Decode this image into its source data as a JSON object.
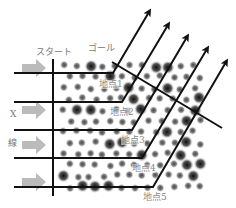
{
  "labels": {
    "start": "スタート",
    "goal": "ゴール",
    "axis_x": "X",
    "axis_line": "線"
  },
  "points": [
    {
      "label": "地点1",
      "turn": [
        113,
        73
      ],
      "tip": [
        149,
        12
      ],
      "lx": 99,
      "ly": 80
    },
    {
      "label": "地点2",
      "turn": [
        122,
        102
      ],
      "tip": [
        168,
        25
      ],
      "lx": 110,
      "ly": 108
    },
    {
      "label": "地点3",
      "turn": [
        132,
        130
      ],
      "tip": [
        187,
        37
      ],
      "lx": 121,
      "ly": 136
    },
    {
      "label": "地点4",
      "turn": [
        142,
        158
      ],
      "tip": [
        207,
        49
      ],
      "lx": 132,
      "ly": 164
    },
    {
      "label": "地点5",
      "turn": [
        153,
        187
      ],
      "tip": [
        226,
        62
      ],
      "lx": 143,
      "ly": 193
    }
  ],
  "colors": {
    "line": "#111111",
    "arrow_fill": "#bbbbbb",
    "label": "#777777"
  }
}
